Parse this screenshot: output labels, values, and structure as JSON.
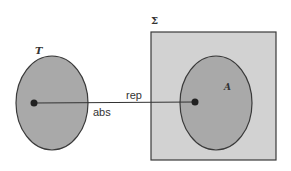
{
  "diagram": {
    "left_set": {
      "label": "T"
    },
    "right_box": {
      "label": "Σ"
    },
    "inner_set": {
      "label": "A"
    },
    "arrow_labels": {
      "top": "rep",
      "bottom": "abs"
    }
  },
  "colors": {
    "set_fill": "#a9a9a9",
    "box_fill": "#d2d2d2",
    "stroke": "#3a3a3a",
    "dot": "#222222"
  }
}
